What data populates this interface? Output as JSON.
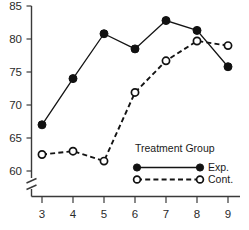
{
  "chart_data": {
    "type": "line",
    "title": "",
    "subtitle": "",
    "xlabel": "",
    "ylabel": "",
    "x": [
      3,
      4,
      5,
      6,
      7,
      8,
      9
    ],
    "xtick_labels": [
      "3",
      "4",
      "5",
      "6",
      "7",
      "8",
      "9"
    ],
    "ytick_labels": [
      "60",
      "65",
      "70",
      "75",
      "80",
      "85"
    ],
    "ytick_values": [
      60,
      65,
      70,
      75,
      80,
      85
    ],
    "xlim": [
      3,
      9
    ],
    "ylim": [
      60,
      85
    ],
    "grid": false,
    "axis_break": true,
    "axis_break_note": "y-axis broken below 60",
    "legend_position": "inside-lower-right",
    "legend_title": "Treatment Group",
    "series": [
      {
        "name": "Exp.",
        "marker": "filled-circle",
        "line_style": "solid",
        "color": "#111111",
        "values": [
          67,
          74,
          80.8,
          78.5,
          82.8,
          81.3,
          75.8
        ]
      },
      {
        "name": "Cont.",
        "marker": "open-circle",
        "line_style": "dashed",
        "color": "#111111",
        "values": [
          62.5,
          63,
          61.5,
          71.9,
          76.7,
          79.7,
          79
        ]
      }
    ]
  },
  "legend": {
    "title": "Treatment Group",
    "entries": [
      {
        "label": "Exp.",
        "marker": "filled-circle",
        "line_style": "solid"
      },
      {
        "label": "Cont.",
        "marker": "open-circle",
        "line_style": "dashed"
      }
    ]
  }
}
